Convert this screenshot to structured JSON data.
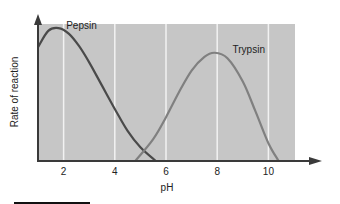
{
  "chart_data": {
    "type": "line",
    "title": "",
    "xlabel": "pH",
    "ylabel": "Rate of reaction",
    "xlim": [
      1,
      12
    ],
    "x_ticks": [
      2,
      4,
      6,
      8,
      10
    ],
    "x_tick_labels": [
      "2",
      "4",
      "6",
      "8",
      "10"
    ],
    "y_ticks": [],
    "grid": "vertical white lines at x ticks",
    "legend": "inline labels",
    "series": [
      {
        "name": "Pepsin",
        "color": "#4a4a4a",
        "points": [
          [
            1.0,
            0.83
          ],
          [
            1.4,
            0.95
          ],
          [
            1.8,
            0.97
          ],
          [
            2.2,
            0.93
          ],
          [
            2.6,
            0.84
          ],
          [
            3.0,
            0.72
          ],
          [
            3.5,
            0.55
          ],
          [
            4.0,
            0.38
          ],
          [
            4.5,
            0.22
          ],
          [
            5.0,
            0.1
          ],
          [
            5.6,
            0.0
          ]
        ]
      },
      {
        "name": "Trypsin",
        "color": "#808080",
        "points": [
          [
            4.8,
            0.0
          ],
          [
            5.5,
            0.16
          ],
          [
            6.0,
            0.32
          ],
          [
            6.5,
            0.5
          ],
          [
            7.0,
            0.66
          ],
          [
            7.5,
            0.76
          ],
          [
            7.9,
            0.79
          ],
          [
            8.4,
            0.75
          ],
          [
            9.0,
            0.58
          ],
          [
            9.5,
            0.36
          ],
          [
            10.0,
            0.13
          ],
          [
            10.4,
            0.0
          ]
        ]
      }
    ],
    "annotations": [
      {
        "text": "Pepsin",
        "x": 2.1,
        "y": 0.98
      },
      {
        "text": "Trypsin",
        "x": 8.6,
        "y": 0.8
      }
    ]
  },
  "colors": {
    "plot_bg": "#c6c6c6",
    "gridline": "#f2f2f2",
    "axis": "#3a3a3a"
  }
}
